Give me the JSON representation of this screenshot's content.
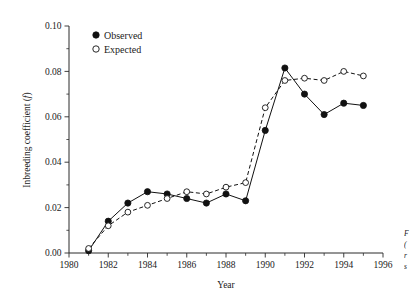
{
  "figure": {
    "background_color": "#ffffff",
    "ink_color": "#111111"
  },
  "chart_data": {
    "type": "line",
    "title": "",
    "xlabel": "Year",
    "ylabel": "Inbreeding coefficient (f)",
    "ylabel_plain": "Inbreeding coefficient",
    "ylabel_symbol": "f",
    "xlim": [
      1980,
      1996
    ],
    "ylim": [
      0.0,
      0.1
    ],
    "xticks": [
      1980,
      1982,
      1984,
      1986,
      1988,
      1990,
      1992,
      1994,
      1996
    ],
    "xtick_labels": [
      "1980",
      "1982",
      "1984",
      "1986",
      "1988",
      "1990",
      "1992",
      "1994",
      "1996"
    ],
    "xtick_minor_step": 1,
    "yticks": [
      0.0,
      0.02,
      0.04,
      0.06,
      0.08,
      0.1
    ],
    "ytick_labels": [
      "0.00",
      "0.02",
      "0.04",
      "0.06",
      "0.08",
      "0.10"
    ],
    "ytick_minor_step": 0.01,
    "grid": false,
    "legend_position": "upper-center-left",
    "x": [
      1981,
      1982,
      1983,
      1984,
      1985,
      1986,
      1987,
      1988,
      1989,
      1990,
      1991,
      1992,
      1993,
      1994,
      1995
    ],
    "series": [
      {
        "name": "Observed",
        "marker": "filled-circle",
        "line_style": "solid",
        "values": [
          0.001,
          0.014,
          0.022,
          0.027,
          0.026,
          0.024,
          0.022,
          0.026,
          0.023,
          0.054,
          0.0815,
          0.07,
          0.061,
          0.066,
          0.065
        ]
      },
      {
        "name": "Expected",
        "marker": "open-circle",
        "line_style": "dashed",
        "values": [
          0.002,
          0.012,
          0.018,
          0.021,
          0.024,
          0.027,
          0.026,
          0.029,
          0.031,
          0.064,
          0.076,
          0.077,
          0.076,
          0.08,
          0.078
        ]
      }
    ]
  },
  "legend": {
    "entries": [
      {
        "label": "Observed",
        "marker": "filled-circle"
      },
      {
        "label": "Expected",
        "marker": "open-circle"
      }
    ]
  },
  "caption": {
    "clipped": true,
    "lines": [
      "F",
      "(",
      "r",
      "s"
    ]
  }
}
